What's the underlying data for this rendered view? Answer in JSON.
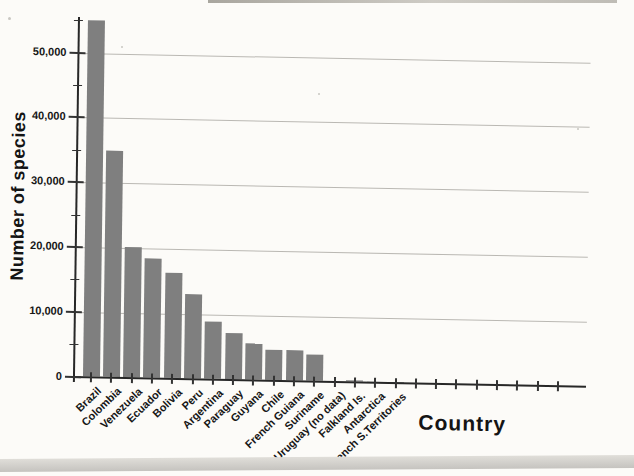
{
  "chart_data": {
    "type": "bar",
    "title": "",
    "xlabel": "Country",
    "ylabel": "Number of species",
    "categories": [
      "Brazil",
      "Colombia",
      "Venezuela",
      "Ecuador",
      "Bolivia",
      "Peru",
      "Argentina",
      "Paraguay",
      "Guyana",
      "Chile",
      "French Guiana",
      "Suriname",
      "Uruguay (no data)",
      "Falkland Is.",
      "Antarctica",
      "French S.Territories"
    ],
    "values": [
      55000,
      35000,
      20200,
      18400,
      16300,
      13000,
      8900,
      7200,
      5700,
      4700,
      4650,
      4100,
      0,
      250,
      150,
      100
    ],
    "ylim": [
      0,
      55500
    ],
    "ytick_values": [
      0,
      10000,
      20000,
      30000,
      40000,
      50000
    ],
    "ytick_labels": [
      "0",
      "10,000",
      "20,000",
      "30,000",
      "40,000",
      "50,000"
    ],
    "yminor_step": 5000,
    "unlabeled_trailing_ticks": 8,
    "grid": "horizontal-major",
    "legend": "none",
    "xlabel_rotation_deg": 45,
    "bar_color": "#7f7f7f",
    "axis_color": "#272727",
    "tick_color": "#333333",
    "grid_color": "#bab8b3"
  }
}
